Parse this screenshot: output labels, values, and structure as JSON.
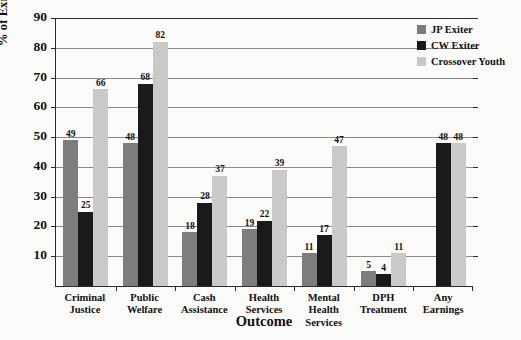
{
  "chart_data": {
    "type": "bar",
    "title": "",
    "xlabel": "Outcome",
    "ylabel": "% of Exiters with outcome",
    "ylim": [
      0,
      90
    ],
    "ytick_step": 10,
    "yticks": [
      10,
      20,
      30,
      40,
      50,
      60,
      70,
      80,
      90
    ],
    "grid": true,
    "legend_position": "top-right",
    "categories": [
      "Criminal Justice",
      "Public Welfare",
      "Cash Assistance",
      "Health Services",
      "Mental Health Services",
      "DPH Treatment",
      "Any Earnings"
    ],
    "category_lines": [
      [
        "Criminal",
        "Justice"
      ],
      [
        "Public Welfare",
        ""
      ],
      [
        "Cash",
        "Assistance"
      ],
      [
        "Health",
        "Services"
      ],
      [
        "Mental Health",
        "Services"
      ],
      [
        "DPH",
        "Treatment"
      ],
      [
        "Any Earnings",
        ""
      ]
    ],
    "series": [
      {
        "name": "JP Exiter",
        "color": "#7d7d7d",
        "values": [
          49,
          48,
          18,
          19,
          11,
          5,
          null
        ]
      },
      {
        "name": "CW Exiter",
        "color": "#1a1a1a",
        "values": [
          25,
          68,
          28,
          22,
          17,
          4,
          48
        ]
      },
      {
        "name": "Crossover Youth",
        "color": "#c9c9c9",
        "values": [
          66,
          82,
          37,
          39,
          47,
          11,
          48
        ]
      }
    ]
  }
}
